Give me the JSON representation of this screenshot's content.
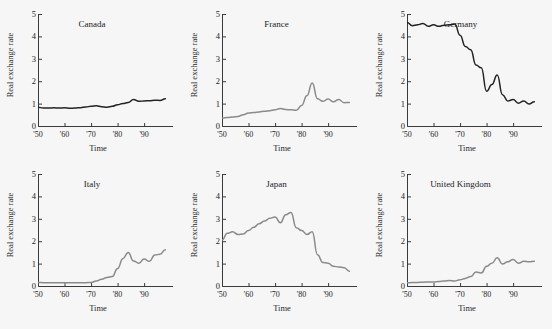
{
  "figure": {
    "top_caption": "",
    "background_color": "#f6f6f7",
    "axis_color": "#3a3a3a",
    "dark_series_color": "#232323",
    "gray_series_color": "#8a8a8a"
  },
  "axes": {
    "ylabel": "Real exchange rate",
    "xlabel": "Time",
    "yticks": [
      "0",
      "1",
      "2",
      "3",
      "4",
      "5"
    ],
    "xticks": [
      "'50",
      "'60",
      "'70",
      "'80",
      "'90"
    ]
  },
  "chart_data": {
    "type": "line",
    "title": "",
    "xlabel": "Time",
    "ylabel": "Real exchange rate",
    "xlim": [
      1950,
      1999
    ],
    "ylim": [
      0,
      5
    ],
    "grid": false,
    "legend": "none",
    "panel_layout": "2 rows x 3 columns",
    "x": [
      1950,
      1952,
      1954,
      1956,
      1958,
      1960,
      1962,
      1964,
      1966,
      1968,
      1970,
      1972,
      1974,
      1976,
      1978,
      1980,
      1982,
      1984,
      1986,
      1988,
      1990,
      1992,
      1994,
      1996,
      1998
    ],
    "panels": [
      {
        "name": "Canada",
        "color": "#232323",
        "values": [
          0.84,
          0.8,
          0.8,
          0.81,
          0.8,
          0.81,
          0.79,
          0.8,
          0.82,
          0.85,
          0.88,
          0.9,
          0.86,
          0.84,
          0.88,
          0.95,
          1.0,
          1.05,
          1.18,
          1.1,
          1.12,
          1.13,
          1.15,
          1.14,
          1.22
        ]
      },
      {
        "name": "France",
        "color": "#8a8a8a",
        "values": [
          0.36,
          0.38,
          0.4,
          0.42,
          0.5,
          0.58,
          0.6,
          0.63,
          0.66,
          0.68,
          0.72,
          0.78,
          0.74,
          0.72,
          0.7,
          0.92,
          1.35,
          1.92,
          1.22,
          1.1,
          1.2,
          1.08,
          1.18,
          1.04,
          1.05
        ]
      },
      {
        "name": "Germany",
        "color": "#232323",
        "values": [
          4.62,
          4.48,
          4.52,
          4.58,
          4.45,
          4.52,
          4.45,
          4.5,
          4.52,
          4.55,
          4.05,
          3.55,
          3.4,
          2.72,
          2.6,
          1.55,
          1.85,
          2.28,
          1.4,
          1.12,
          1.18,
          1.02,
          1.12,
          0.98,
          1.08
        ]
      },
      {
        "name": "Italy",
        "color": "#8a8a8a",
        "values": [
          0.16,
          0.15,
          0.15,
          0.15,
          0.15,
          0.15,
          0.15,
          0.15,
          0.15,
          0.15,
          0.16,
          0.22,
          0.3,
          0.38,
          0.42,
          0.78,
          1.22,
          1.5,
          1.12,
          1.02,
          1.2,
          1.1,
          1.38,
          1.42,
          1.62
        ]
      },
      {
        "name": "Japan",
        "color": "#8a8a8a",
        "values": [
          2.05,
          2.35,
          2.42,
          2.3,
          2.32,
          2.48,
          2.62,
          2.78,
          2.9,
          3.02,
          3.08,
          2.82,
          3.18,
          3.28,
          2.6,
          2.48,
          2.3,
          2.42,
          1.4,
          1.05,
          1.02,
          0.88,
          0.85,
          0.82,
          0.66
        ]
      },
      {
        "name": "United Kingdom",
        "color": "#8a8a8a",
        "values": [
          0.14,
          0.16,
          0.16,
          0.17,
          0.18,
          0.18,
          0.2,
          0.22,
          0.24,
          0.22,
          0.28,
          0.34,
          0.42,
          0.62,
          0.58,
          0.88,
          1.02,
          1.26,
          0.98,
          1.08,
          1.18,
          1.02,
          1.1,
          1.08,
          1.1
        ]
      }
    ]
  }
}
